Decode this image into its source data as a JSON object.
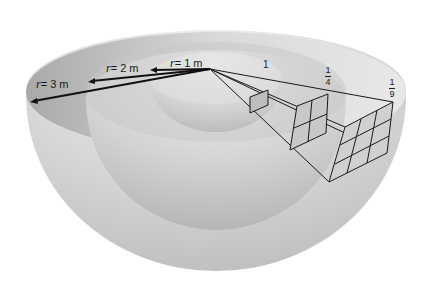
{
  "figure": {
    "radius_labels": [
      {
        "var": "r",
        "text": "= 1 m"
      },
      {
        "var": "r",
        "text": "= 2 m"
      },
      {
        "var": "r",
        "text": "= 3 m"
      }
    ],
    "intensity_labels": [
      {
        "value": "1"
      },
      {
        "numerator": "1",
        "denominator": "4"
      },
      {
        "numerator": "1",
        "denominator": "9"
      }
    ],
    "grids": [
      {
        "shell": "r = 1 m",
        "cells": "1x1"
      },
      {
        "shell": "r = 2 m",
        "cells": "2x2"
      },
      {
        "shell": "r = 3 m",
        "cells": "3x3"
      }
    ],
    "colors": {
      "background": "#ffffff",
      "shell_light": "#f2f2f2",
      "shell_mid": "#cfcfcf",
      "shell_dark": "#a8a8a8",
      "lines": "#1a1a1a"
    }
  }
}
